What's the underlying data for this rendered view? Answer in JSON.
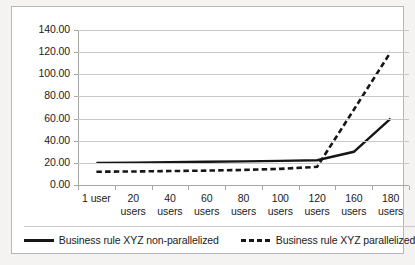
{
  "chart_data": {
    "type": "line",
    "title": "",
    "xlabel": "",
    "ylabel": "",
    "categories": [
      "1 user",
      "20 users",
      "40 users",
      "60 users",
      "80 users",
      "100 users",
      "120 users",
      "160 users",
      "180 users"
    ],
    "ylim": [
      0,
      140
    ],
    "ytick_step": 20,
    "ytick_labels": [
      "0.00",
      "20.00",
      "40.00",
      "60.00",
      "80.00",
      "100.00",
      "120.00",
      "140.00"
    ],
    "grid": true,
    "legend_position": "bottom",
    "series": [
      {
        "name": "Business rule XYZ non-parallelized",
        "style": "solid",
        "color": "#161616",
        "values": [
          20.0,
          20.2,
          20.6,
          21.0,
          21.3,
          21.8,
          22.4,
          30.0,
          60.0
        ]
      },
      {
        "name": "Business rule XYZ parallelized",
        "style": "dashed",
        "color": "#161616",
        "values": [
          12.0,
          12.2,
          12.6,
          13.0,
          13.6,
          14.6,
          16.4,
          68.0,
          120.0
        ]
      }
    ]
  },
  "legend": {
    "entries": [
      {
        "label": "Business rule XYZ non-parallelized",
        "style": "solid"
      },
      {
        "label": "Business rule XYZ parallelized",
        "style": "dashed"
      }
    ]
  },
  "colors": {
    "line": "#161616",
    "grid": "#c9c9c7",
    "axis": "#a6a6a4",
    "frame": "#b7b7b5",
    "plot_background": "#ffffff",
    "figure_background": "#f4f3f1",
    "text": "#1b1b1b"
  }
}
